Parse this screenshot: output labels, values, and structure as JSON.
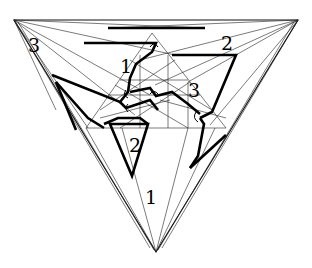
{
  "diagram": {
    "title": "",
    "labels": [
      {
        "text": "3",
        "x": 28,
        "y": 52
      },
      {
        "text": "2",
        "x": 221,
        "y": 50
      },
      {
        "text": "1",
        "x": 120,
        "y": 73
      },
      {
        "text": "3",
        "x": 188,
        "y": 97
      },
      {
        "text": "2",
        "x": 129,
        "y": 152
      },
      {
        "text": "1",
        "x": 145,
        "y": 204
      }
    ]
  }
}
